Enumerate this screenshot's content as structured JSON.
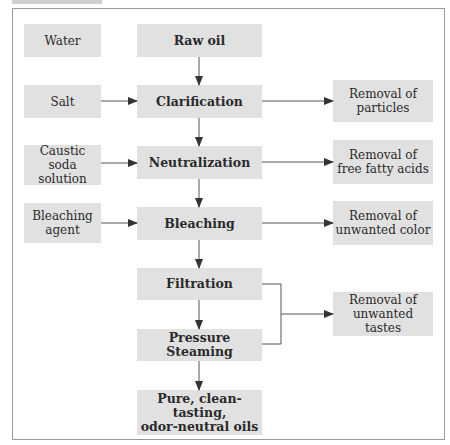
{
  "diagram": {
    "inputs": [
      {
        "id": "water",
        "label": "Water"
      },
      {
        "id": "salt",
        "label": "Salt"
      },
      {
        "id": "caustic",
        "label": "Caustic soda\nsolution"
      },
      {
        "id": "bleach-agent",
        "label": "Bleaching\nagent"
      }
    ],
    "steps": [
      {
        "id": "raw-oil",
        "label": "Raw oil"
      },
      {
        "id": "clarification",
        "label": "Clarification"
      },
      {
        "id": "neutralization",
        "label": "Neutralization"
      },
      {
        "id": "bleaching",
        "label": "Bleaching"
      },
      {
        "id": "filtration",
        "label": "Filtration"
      },
      {
        "id": "pressure-steaming",
        "label": "Pressure Steaming"
      },
      {
        "id": "final",
        "label": "Pure, clean-tasting,\nodor-neutral oils"
      }
    ],
    "outputs": [
      {
        "id": "particles",
        "label": "Removal of\nparticles"
      },
      {
        "id": "ffa",
        "label": "Removal of\nfree fatty acids"
      },
      {
        "id": "color",
        "label": "Removal of\nunwanted color"
      },
      {
        "id": "tastes",
        "label": "Removal of\nunwanted tastes"
      }
    ],
    "colors": {
      "box": "#e1e1e1",
      "line": "#555555",
      "frame": "#9a9a9a"
    }
  }
}
